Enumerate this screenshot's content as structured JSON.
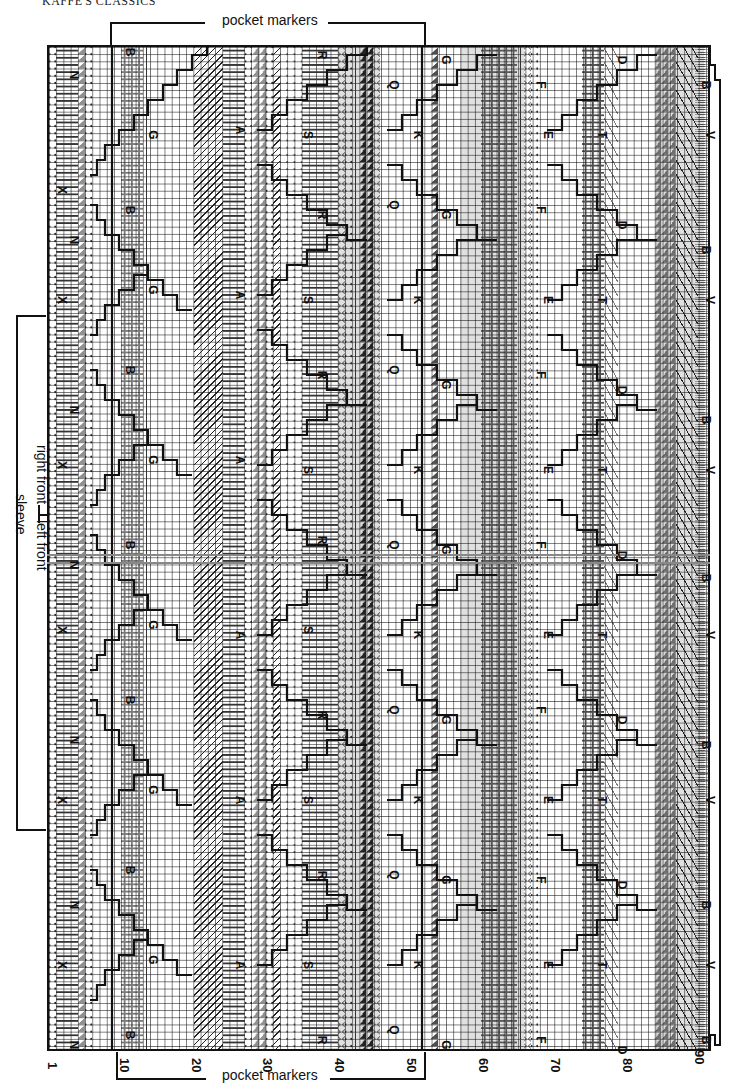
{
  "header": {
    "title": "KAFFE'S CLASSICS"
  },
  "annotations": {
    "top_pocket_markers": "pocket markers",
    "bottom_pocket_markers": "pocket markers",
    "sleeve": "sleeve",
    "right_front": "right front",
    "left_front": "left front"
  },
  "chart_data": {
    "type": "table",
    "xlabel": "stitches",
    "x_ticks": [
      "1",
      "10",
      "20",
      "30",
      "40",
      "50",
      "60",
      "70",
      "80",
      "90"
    ],
    "x_tick_positions_px": [
      47,
      117,
      190,
      262,
      333,
      405,
      477,
      550,
      620,
      693
    ],
    "stitch_count": 90,
    "row_count_approx": 140,
    "grid": true,
    "colour_key_letters": [
      "N",
      "X",
      "B",
      "G",
      "A",
      "R",
      "S",
      "Q",
      "K",
      "F",
      "E",
      "D",
      "T",
      "V"
    ],
    "pocket_markers_span_stitches": [
      10,
      52
    ],
    "regions": [
      {
        "letter": "N",
        "column": 1,
        "y_positions": [
          75,
          240,
          410,
          565,
          740,
          905,
          1060
        ]
      },
      {
        "letter": "X",
        "column": 1,
        "y_positions": [
          190,
          300,
          465,
          630,
          800,
          965
        ]
      },
      {
        "letter": "B",
        "column": 2,
        "y_positions": [
          52,
          205,
          370,
          545,
          700,
          870,
          1035
        ]
      },
      {
        "letter": "G",
        "column": 2,
        "y_positions": [
          135,
          290,
          460,
          625,
          790,
          960
        ]
      },
      {
        "letter": "A",
        "column": 3,
        "y_positions": [
          130,
          290,
          460,
          635,
          800,
          965
        ]
      },
      {
        "letter": "R",
        "column": 4,
        "y_positions": [
          55,
          210,
          375,
          540,
          715,
          875,
          1040
        ]
      },
      {
        "letter": "S",
        "column": 4,
        "y_positions": [
          135,
          300,
          470,
          630,
          800,
          965
        ]
      },
      {
        "letter": "Q",
        "column": 5,
        "y_positions": [
          85,
          205,
          370,
          545,
          710,
          875,
          1045
        ]
      },
      {
        "letter": "K",
        "column": 5,
        "y_positions": [
          135,
          300,
          470,
          635,
          800,
          965
        ]
      },
      {
        "letter": "G",
        "column": 6,
        "y_positions": [
          60,
          215,
          385,
          550,
          720,
          880,
          1045
        ]
      },
      {
        "letter": "F",
        "column": 6,
        "y_positions": [
          85,
          210,
          375,
          545,
          710,
          880,
          1040
        ]
      },
      {
        "letter": "E",
        "column": 7,
        "y_positions": [
          135,
          300,
          470,
          635,
          800,
          965
        ]
      },
      {
        "letter": "D",
        "column": 7,
        "y_positions": [
          60,
          225,
          390,
          555,
          720,
          885,
          1050
        ]
      },
      {
        "letter": "T",
        "column": 7,
        "y_positions": [
          135,
          300,
          470,
          635,
          800,
          965
        ]
      },
      {
        "letter": "B",
        "column": 8,
        "y_positions": [
          85,
          250,
          420,
          575,
          745,
          905,
          1055
        ]
      },
      {
        "letter": "V",
        "column": 8,
        "y_positions": [
          135,
          300,
          470,
          635,
          800,
          965
        ]
      }
    ]
  },
  "ticks": [
    {
      "label": "1",
      "x": 48,
      "y": 1062
    },
    {
      "label": "10",
      "x": 120,
      "y": 1058
    },
    {
      "label": "20",
      "x": 192,
      "y": 1058
    },
    {
      "label": "30",
      "x": 263,
      "y": 1058
    },
    {
      "label": "40",
      "x": 335,
      "y": 1058
    },
    {
      "label": "50",
      "x": 407,
      "y": 1058
    },
    {
      "label": "60",
      "x": 479,
      "y": 1058
    },
    {
      "label": "70",
      "x": 551,
      "y": 1058
    },
    {
      "label": "80",
      "x": 623,
      "y": 1058
    },
    {
      "label": "90",
      "x": 695,
      "y": 1050
    }
  ],
  "letters": [
    {
      "t": "N",
      "x": 74,
      "y": 75
    },
    {
      "t": "X",
      "x": 62,
      "y": 190
    },
    {
      "t": "N",
      "x": 74,
      "y": 240
    },
    {
      "t": "X",
      "x": 62,
      "y": 300
    },
    {
      "t": "N",
      "x": 74,
      "y": 410
    },
    {
      "t": "X",
      "x": 62,
      "y": 465
    },
    {
      "t": "N",
      "x": 74,
      "y": 565
    },
    {
      "t": "X",
      "x": 62,
      "y": 630
    },
    {
      "t": "N",
      "x": 74,
      "y": 740
    },
    {
      "t": "X",
      "x": 62,
      "y": 800
    },
    {
      "t": "N",
      "x": 74,
      "y": 905
    },
    {
      "t": "X",
      "x": 62,
      "y": 965
    },
    {
      "t": "N",
      "x": 74,
      "y": 1045
    },
    {
      "t": "B",
      "x": 130,
      "y": 52
    },
    {
      "t": "G",
      "x": 153,
      "y": 135
    },
    {
      "t": "B",
      "x": 130,
      "y": 210
    },
    {
      "t": "G",
      "x": 153,
      "y": 290
    },
    {
      "t": "B",
      "x": 130,
      "y": 370
    },
    {
      "t": "G",
      "x": 153,
      "y": 460
    },
    {
      "t": "B",
      "x": 130,
      "y": 545
    },
    {
      "t": "G",
      "x": 153,
      "y": 625
    },
    {
      "t": "B",
      "x": 130,
      "y": 700
    },
    {
      "t": "G",
      "x": 153,
      "y": 790
    },
    {
      "t": "B",
      "x": 130,
      "y": 870
    },
    {
      "t": "G",
      "x": 153,
      "y": 960
    },
    {
      "t": "B",
      "x": 130,
      "y": 1035
    },
    {
      "t": "A",
      "x": 240,
      "y": 130
    },
    {
      "t": "A",
      "x": 240,
      "y": 295
    },
    {
      "t": "A",
      "x": 240,
      "y": 460
    },
    {
      "t": "A",
      "x": 240,
      "y": 635
    },
    {
      "t": "A",
      "x": 240,
      "y": 800
    },
    {
      "t": "A",
      "x": 240,
      "y": 965
    },
    {
      "t": "R",
      "x": 322,
      "y": 55
    },
    {
      "t": "S",
      "x": 308,
      "y": 135
    },
    {
      "t": "R",
      "x": 322,
      "y": 215
    },
    {
      "t": "S",
      "x": 308,
      "y": 300
    },
    {
      "t": "R",
      "x": 322,
      "y": 375
    },
    {
      "t": "S",
      "x": 308,
      "y": 470
    },
    {
      "t": "R",
      "x": 322,
      "y": 540
    },
    {
      "t": "S",
      "x": 308,
      "y": 630
    },
    {
      "t": "R",
      "x": 322,
      "y": 715
    },
    {
      "t": "S",
      "x": 308,
      "y": 800
    },
    {
      "t": "R",
      "x": 322,
      "y": 875
    },
    {
      "t": "S",
      "x": 308,
      "y": 965
    },
    {
      "t": "R",
      "x": 322,
      "y": 1040
    },
    {
      "t": "Q",
      "x": 394,
      "y": 85
    },
    {
      "t": "K",
      "x": 418,
      "y": 135
    },
    {
      "t": "Q",
      "x": 394,
      "y": 205
    },
    {
      "t": "K",
      "x": 418,
      "y": 300
    },
    {
      "t": "Q",
      "x": 394,
      "y": 370
    },
    {
      "t": "K",
      "x": 418,
      "y": 470
    },
    {
      "t": "Q",
      "x": 394,
      "y": 545
    },
    {
      "t": "K",
      "x": 418,
      "y": 635
    },
    {
      "t": "Q",
      "x": 394,
      "y": 710
    },
    {
      "t": "K",
      "x": 418,
      "y": 800
    },
    {
      "t": "Q",
      "x": 394,
      "y": 875
    },
    {
      "t": "K",
      "x": 418,
      "y": 965
    },
    {
      "t": "Q",
      "x": 394,
      "y": 1030
    },
    {
      "t": "G",
      "x": 446,
      "y": 60
    },
    {
      "t": "G",
      "x": 446,
      "y": 215
    },
    {
      "t": "G",
      "x": 446,
      "y": 385
    },
    {
      "t": "G",
      "x": 446,
      "y": 550
    },
    {
      "t": "G",
      "x": 446,
      "y": 720
    },
    {
      "t": "G",
      "x": 446,
      "y": 880
    },
    {
      "t": "G",
      "x": 446,
      "y": 1045
    },
    {
      "t": "F",
      "x": 541,
      "y": 85
    },
    {
      "t": "E",
      "x": 548,
      "y": 135
    },
    {
      "t": "F",
      "x": 541,
      "y": 210
    },
    {
      "t": "E",
      "x": 548,
      "y": 300
    },
    {
      "t": "F",
      "x": 541,
      "y": 375
    },
    {
      "t": "E",
      "x": 548,
      "y": 470
    },
    {
      "t": "F",
      "x": 541,
      "y": 545
    },
    {
      "t": "E",
      "x": 548,
      "y": 635
    },
    {
      "t": "F",
      "x": 541,
      "y": 710
    },
    {
      "t": "E",
      "x": 548,
      "y": 800
    },
    {
      "t": "F",
      "x": 541,
      "y": 880
    },
    {
      "t": "E",
      "x": 548,
      "y": 965
    },
    {
      "t": "F",
      "x": 541,
      "y": 1040
    },
    {
      "t": "D",
      "x": 622,
      "y": 60
    },
    {
      "t": "T",
      "x": 602,
      "y": 135
    },
    {
      "t": "D",
      "x": 622,
      "y": 225
    },
    {
      "t": "T",
      "x": 602,
      "y": 300
    },
    {
      "t": "D",
      "x": 622,
      "y": 390
    },
    {
      "t": "T",
      "x": 602,
      "y": 470
    },
    {
      "t": "D",
      "x": 622,
      "y": 555
    },
    {
      "t": "T",
      "x": 602,
      "y": 635
    },
    {
      "t": "D",
      "x": 622,
      "y": 720
    },
    {
      "t": "T",
      "x": 602,
      "y": 800
    },
    {
      "t": "D",
      "x": 622,
      "y": 885
    },
    {
      "t": "T",
      "x": 602,
      "y": 965
    },
    {
      "t": "D",
      "x": 622,
      "y": 1050
    },
    {
      "t": "B",
      "x": 706,
      "y": 85
    },
    {
      "t": "V",
      "x": 710,
      "y": 135
    },
    {
      "t": "B",
      "x": 706,
      "y": 250
    },
    {
      "t": "V",
      "x": 710,
      "y": 300
    },
    {
      "t": "B",
      "x": 706,
      "y": 420
    },
    {
      "t": "V",
      "x": 710,
      "y": 470
    },
    {
      "t": "B",
      "x": 706,
      "y": 578
    },
    {
      "t": "V",
      "x": 710,
      "y": 635
    },
    {
      "t": "B",
      "x": 706,
      "y": 745
    },
    {
      "t": "V",
      "x": 710,
      "y": 800
    },
    {
      "t": "B",
      "x": 706,
      "y": 905
    },
    {
      "t": "V",
      "x": 710,
      "y": 965
    },
    {
      "t": "B",
      "x": 706,
      "y": 1040
    }
  ]
}
